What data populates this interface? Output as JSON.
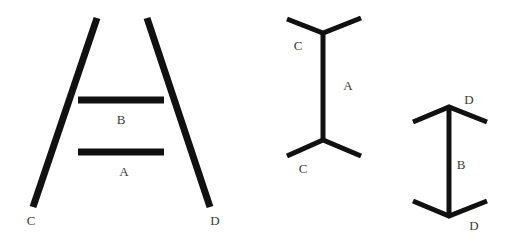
{
  "figure": {
    "stroke_color": "#111111",
    "label_color": "#3a3a3a",
    "background": "#ffffff"
  },
  "ponzo": {
    "labels": {
      "bar_upper": "B",
      "bar_lower": "A",
      "left_leg": "C",
      "right_leg": "D"
    }
  },
  "muller_lyer_out": {
    "labels": {
      "top_fin": "C",
      "shaft": "A",
      "bottom_fin": "C"
    }
  },
  "muller_lyer_in": {
    "labels": {
      "top_arrow": "D",
      "shaft": "B",
      "bottom_arrow": "D"
    }
  }
}
